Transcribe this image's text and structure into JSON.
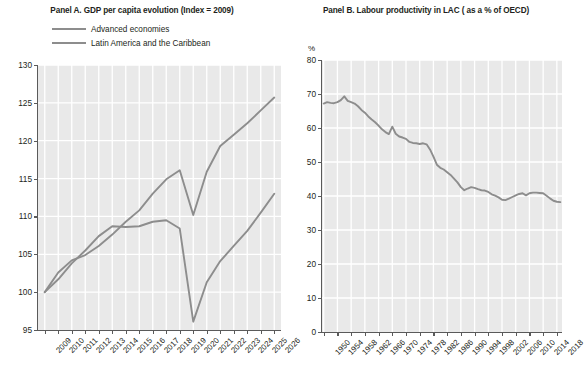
{
  "panel_a": {
    "title": "Panel A. GDP per capita evolution (Index = 2009)",
    "legend": [
      {
        "label": "Advanced economies",
        "color": "#8d8d8d"
      },
      {
        "label": "Latin America and the Caribbean",
        "color": "#8d8d8d"
      }
    ]
  },
  "panel_b": {
    "title": "Panel B. Labour productivity in LAC ( as a % of OECD)",
    "unit_label": "%"
  },
  "chart_data": [
    {
      "type": "line",
      "title": "Panel A. GDP per capita evolution (Index = 2009)",
      "xlabel": "",
      "ylabel": "",
      "ylim": [
        95,
        130
      ],
      "ytick_labels": [
        "95",
        "100",
        "105",
        "110",
        "115",
        "120",
        "125",
        "130"
      ],
      "yticks": [
        95,
        100,
        105,
        110,
        115,
        120,
        125,
        130
      ],
      "grid": true,
      "legend_position": "above-plot",
      "x": [
        2009,
        2010,
        2011,
        2012,
        2013,
        2014,
        2015,
        2016,
        2017,
        2018,
        2019,
        2020,
        2021,
        2022,
        2023,
        2024,
        2025,
        2026
      ],
      "xtick_labels": [
        "2009",
        "2010",
        "2011",
        "2012",
        "2013",
        "2014",
        "2015",
        "2016",
        "2017",
        "2018",
        "2019",
        "2020",
        "2021",
        "2022",
        "2023",
        "2024",
        "2025",
        "2026"
      ],
      "series": [
        {
          "name": "Advanced economies",
          "color": "#8d8d8d",
          "values": [
            100.0,
            102.6,
            104.2,
            104.9,
            106.1,
            107.6,
            109.3,
            110.8,
            113.0,
            114.9,
            116.1,
            110.2,
            115.9,
            119.3,
            120.8,
            122.3,
            124.0,
            125.7
          ]
        },
        {
          "name": "Latin America and the Caribbean",
          "color": "#8d8d8d",
          "values": [
            100.0,
            101.7,
            103.8,
            105.5,
            107.4,
            108.7,
            108.6,
            108.7,
            109.3,
            109.5,
            108.4,
            96.1,
            101.3,
            104.1,
            106.1,
            108.1,
            110.5,
            113.0
          ]
        }
      ]
    },
    {
      "type": "line",
      "title": "Panel B. Labour productivity in LAC ( as a % of OECD)",
      "xlabel": "",
      "ylabel": "%",
      "ylim": [
        0,
        80
      ],
      "ytick_labels": [
        "0",
        "10",
        "20",
        "30",
        "40",
        "50",
        "60",
        "70",
        "80"
      ],
      "yticks": [
        0,
        10,
        20,
        30,
        40,
        50,
        60,
        70,
        80
      ],
      "grid": true,
      "legend_position": "none",
      "xtick_labels": [
        "1950",
        "1954",
        "1958",
        "1962",
        "1966",
        "1970",
        "1974",
        "1978",
        "1982",
        "1986",
        "1990",
        "1994",
        "1998",
        "2002",
        "2006",
        "2010",
        "2014",
        "2018"
      ],
      "xticks": [
        1950,
        1954,
        1958,
        1962,
        1966,
        1970,
        1974,
        1978,
        1982,
        1986,
        1990,
        1994,
        1998,
        2002,
        2006,
        2010,
        2014,
        2018
      ],
      "x": [
        1950,
        1951,
        1952,
        1953,
        1954,
        1955,
        1956,
        1957,
        1958,
        1959,
        1960,
        1961,
        1962,
        1963,
        1964,
        1965,
        1966,
        1967,
        1968,
        1969,
        1970,
        1971,
        1972,
        1973,
        1974,
        1975,
        1976,
        1977,
        1978,
        1979,
        1980,
        1981,
        1982,
        1983,
        1984,
        1985,
        1986,
        1987,
        1988,
        1989,
        1990,
        1991,
        1992,
        1993,
        1994,
        1995,
        1996,
        1997,
        1998,
        1999,
        2000,
        2001,
        2002,
        2003,
        2004,
        2005,
        2006,
        2007,
        2008,
        2009,
        2010,
        2011,
        2012,
        2013,
        2014,
        2015,
        2016,
        2017,
        2018,
        2019
      ],
      "series": [
        {
          "name": "Labour productivity in LAC (% of OECD)",
          "color": "#8d8d8d",
          "values": [
            67.2,
            67.6,
            67.4,
            67.3,
            67.6,
            68.2,
            69.3,
            68.0,
            67.6,
            67.2,
            66.4,
            65.3,
            64.5,
            63.4,
            62.5,
            61.7,
            60.7,
            59.6,
            58.8,
            58.2,
            60.4,
            58.3,
            57.5,
            57.2,
            56.8,
            55.9,
            55.6,
            55.5,
            55.3,
            55.5,
            55.2,
            53.7,
            51.6,
            49.2,
            48.3,
            47.8,
            47.0,
            46.2,
            45.1,
            44.0,
            42.6,
            41.7,
            42.2,
            42.6,
            42.4,
            42.0,
            41.7,
            41.6,
            41.2,
            40.5,
            40.1,
            39.6,
            38.9,
            38.8,
            39.2,
            39.7,
            40.2,
            40.6,
            40.8,
            40.2,
            40.8,
            41.0,
            41.0,
            40.9,
            40.8,
            40.1,
            39.3,
            38.6,
            38.3,
            38.2
          ]
        }
      ]
    }
  ]
}
